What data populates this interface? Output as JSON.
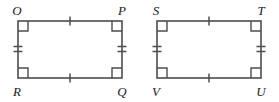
{
  "figure": {
    "type": "geometry-diagram",
    "stroke_color": "#4d4d4d",
    "label_color": "#1a1a1a",
    "background_color": "#ffffff",
    "shapes": [
      {
        "name": "rectangle-orqp",
        "vertices": {
          "top_left": {
            "label": "O",
            "x": 18,
            "y": 21
          },
          "top_right": {
            "label": "P",
            "x": 122,
            "y": 21
          },
          "bottom_right": {
            "label": "Q",
            "x": 122,
            "y": 78
          },
          "bottom_left": {
            "label": "R",
            "x": 18,
            "y": 78
          }
        },
        "label_positions": {
          "top_left": {
            "x": 15,
            "y": 15
          },
          "top_right": {
            "x": 119,
            "y": 15
          },
          "bottom_right": {
            "x": 119,
            "y": 94
          },
          "bottom_left": {
            "x": 15,
            "y": 94
          }
        },
        "right_angle_marks": 4,
        "ticks": {
          "top": 1,
          "bottom": 1,
          "left": 2,
          "right": 2
        }
      },
      {
        "name": "rectangle-stuv",
        "vertices": {
          "top_left": {
            "label": "S",
            "x": 157,
            "y": 21
          },
          "top_right": {
            "label": "T",
            "x": 261,
            "y": 21
          },
          "bottom_right": {
            "label": "U",
            "x": 261,
            "y": 78
          },
          "bottom_left": {
            "label": "V",
            "x": 157,
            "y": 78
          }
        },
        "label_positions": {
          "top_left": {
            "x": 154,
            "y": 15
          },
          "top_right": {
            "x": 258,
            "y": 15
          },
          "bottom_right": {
            "x": 258,
            "y": 94
          },
          "bottom_left": {
            "x": 154,
            "y": 94
          }
        },
        "right_angle_marks": 4,
        "ticks": {
          "top": 1,
          "bottom": 1,
          "left": 2,
          "right": 2
        }
      }
    ],
    "labels": {
      "o": "O",
      "p": "P",
      "q": "Q",
      "r": "R",
      "s": "S",
      "t": "T",
      "u": "U",
      "v": "V"
    }
  }
}
